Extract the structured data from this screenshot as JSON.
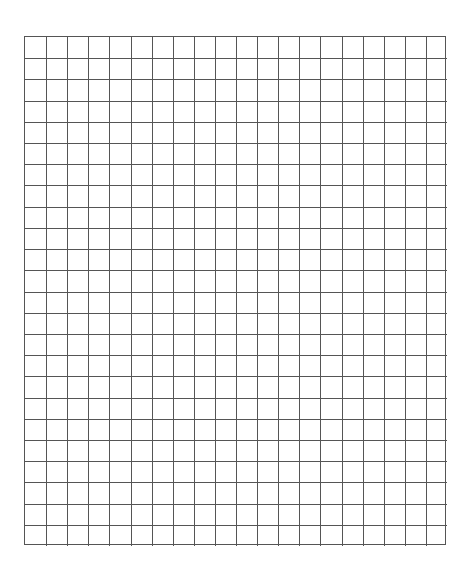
{
  "page": {
    "type": "graph-paper-worksheet"
  },
  "grid": {
    "columns": 20,
    "rows": 24,
    "line_color": "#555555",
    "background": "#ffffff"
  }
}
